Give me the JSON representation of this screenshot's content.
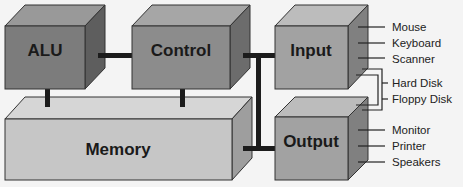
{
  "diagram": {
    "type": "computer-architecture-block-diagram",
    "colors": {
      "background": "#f4f4f4",
      "alu_front": "#7c7c7c",
      "control_front": "#8c8c8c",
      "io_front": "#a2a2a2",
      "memory_front": "#c6c6c6",
      "connector": "#1c1c1c"
    },
    "blocks": {
      "alu": {
        "label": "ALU"
      },
      "control": {
        "label": "Control"
      },
      "input": {
        "label": "Input"
      },
      "memory": {
        "label": "Memory"
      },
      "output": {
        "label": "Output"
      }
    },
    "input_devices": [
      "Mouse",
      "Keyboard",
      "Scanner"
    ],
    "storage_devices": [
      "Hard Disk",
      "Floppy Disk"
    ],
    "output_devices": [
      "Monitor",
      "Printer",
      "Speakers"
    ],
    "connections": [
      [
        "ALU",
        "Control"
      ],
      [
        "ALU",
        "Memory"
      ],
      [
        "Control",
        "Memory"
      ],
      [
        "Control",
        "Input"
      ],
      [
        "Control",
        "Output"
      ],
      [
        "Memory",
        "Output"
      ]
    ]
  }
}
